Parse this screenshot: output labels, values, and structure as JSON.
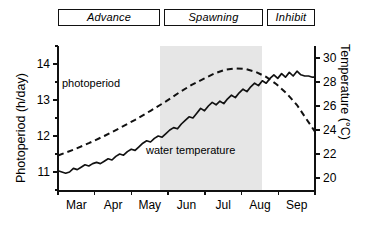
{
  "banner": {
    "phases": [
      {
        "label": "Advance"
      },
      {
        "label": "Spawning"
      },
      {
        "label": "Inhibit"
      }
    ]
  },
  "axes": {
    "left": {
      "title": "Photoperiod (h/day)",
      "ticks": [
        "11",
        "12",
        "13",
        "14"
      ],
      "min": 10.5,
      "max": 14.5
    },
    "right": {
      "title": "Temperature (°C)",
      "ticks": [
        "20",
        "22",
        "24",
        "26",
        "28",
        "30"
      ],
      "min": 19.0,
      "max": 31.0
    },
    "x": {
      "ticks": [
        "Mar",
        "Apr",
        "May",
        "Jun",
        "Jul",
        "Aug",
        "Sep"
      ]
    }
  },
  "series_labels": {
    "photoperiod": "photoperiod",
    "water_temperature": "water temperature"
  },
  "colors": {
    "line": "#111111",
    "shading": "#e6e6e6",
    "background": "#ffffff"
  },
  "chart_data": {
    "type": "line",
    "title": "",
    "xlabel": "",
    "ylabel": "Photoperiod (h/day)",
    "y2label": "Temperature (°C)",
    "ylim": [
      10.5,
      14.5
    ],
    "y2lim": [
      19.0,
      31.0
    ],
    "grid": false,
    "legend": "inline-annotations",
    "x_tick_labels": [
      "Mar",
      "Apr",
      "May",
      "Jun",
      "Jul",
      "Aug",
      "Sep"
    ],
    "shaded_region": {
      "label": "Spawning",
      "x_start": "mid-May",
      "x_end": "mid-Sep"
    },
    "phase_bands": [
      {
        "label": "Advance",
        "x_start": "Feb",
        "x_end": "mid-May"
      },
      {
        "label": "Spawning",
        "x_start": "mid-May",
        "x_end": "mid-Sep"
      },
      {
        "label": "Inhibit",
        "x_start": "mid-Sep",
        "x_end": "Oct"
      }
    ],
    "series": [
      {
        "name": "photoperiod",
        "axis": "left",
        "style": "dashed",
        "units": "h/day",
        "points": [
          {
            "x": 0.0,
            "y": 11.46
          },
          {
            "x": 0.06,
            "y": 11.62
          },
          {
            "x": 0.12,
            "y": 11.8
          },
          {
            "x": 0.18,
            "y": 12.0
          },
          {
            "x": 0.24,
            "y": 12.22
          },
          {
            "x": 0.3,
            "y": 12.45
          },
          {
            "x": 0.36,
            "y": 12.7
          },
          {
            "x": 0.42,
            "y": 12.96
          },
          {
            "x": 0.47,
            "y": 13.2
          },
          {
            "x": 0.52,
            "y": 13.42
          },
          {
            "x": 0.57,
            "y": 13.6
          },
          {
            "x": 0.61,
            "y": 13.74
          },
          {
            "x": 0.65,
            "y": 13.84
          },
          {
            "x": 0.69,
            "y": 13.88
          },
          {
            "x": 0.73,
            "y": 13.86
          },
          {
            "x": 0.77,
            "y": 13.78
          },
          {
            "x": 0.81,
            "y": 13.64
          },
          {
            "x": 0.85,
            "y": 13.44
          },
          {
            "x": 0.89,
            "y": 13.18
          },
          {
            "x": 0.93,
            "y": 12.86
          },
          {
            "x": 0.96,
            "y": 12.54
          },
          {
            "x": 1.0,
            "y": 12.12
          }
        ]
      },
      {
        "name": "water temperature",
        "axis": "right",
        "style": "solid",
        "units": "°C",
        "points": [
          {
            "x": 0.0,
            "y": 20.6
          },
          {
            "x": 0.015,
            "y": 20.5
          },
          {
            "x": 0.03,
            "y": 20.4
          },
          {
            "x": 0.045,
            "y": 20.5
          },
          {
            "x": 0.06,
            "y": 20.8
          },
          {
            "x": 0.075,
            "y": 20.7
          },
          {
            "x": 0.09,
            "y": 20.9
          },
          {
            "x": 0.105,
            "y": 21.1
          },
          {
            "x": 0.12,
            "y": 21.0
          },
          {
            "x": 0.135,
            "y": 21.2
          },
          {
            "x": 0.15,
            "y": 21.3
          },
          {
            "x": 0.165,
            "y": 21.2
          },
          {
            "x": 0.18,
            "y": 21.4
          },
          {
            "x": 0.195,
            "y": 21.6
          },
          {
            "x": 0.21,
            "y": 21.5
          },
          {
            "x": 0.225,
            "y": 21.8
          },
          {
            "x": 0.24,
            "y": 22.0
          },
          {
            "x": 0.255,
            "y": 21.9
          },
          {
            "x": 0.27,
            "y": 22.2
          },
          {
            "x": 0.285,
            "y": 22.4
          },
          {
            "x": 0.3,
            "y": 22.3
          },
          {
            "x": 0.315,
            "y": 22.6
          },
          {
            "x": 0.33,
            "y": 22.9
          },
          {
            "x": 0.345,
            "y": 23.1
          },
          {
            "x": 0.36,
            "y": 23.0
          },
          {
            "x": 0.375,
            "y": 23.3
          },
          {
            "x": 0.39,
            "y": 23.5
          },
          {
            "x": 0.405,
            "y": 23.4
          },
          {
            "x": 0.42,
            "y": 23.7
          },
          {
            "x": 0.435,
            "y": 24.0
          },
          {
            "x": 0.45,
            "y": 24.2
          },
          {
            "x": 0.465,
            "y": 24.1
          },
          {
            "x": 0.48,
            "y": 24.5
          },
          {
            "x": 0.495,
            "y": 24.8
          },
          {
            "x": 0.51,
            "y": 25.1
          },
          {
            "x": 0.525,
            "y": 25.0
          },
          {
            "x": 0.54,
            "y": 25.4
          },
          {
            "x": 0.555,
            "y": 25.8
          },
          {
            "x": 0.57,
            "y": 25.6
          },
          {
            "x": 0.585,
            "y": 26.0
          },
          {
            "x": 0.6,
            "y": 26.3
          },
          {
            "x": 0.615,
            "y": 26.1
          },
          {
            "x": 0.63,
            "y": 26.4
          },
          {
            "x": 0.645,
            "y": 26.2
          },
          {
            "x": 0.66,
            "y": 26.6
          },
          {
            "x": 0.675,
            "y": 26.9
          },
          {
            "x": 0.69,
            "y": 26.7
          },
          {
            "x": 0.705,
            "y": 27.1
          },
          {
            "x": 0.72,
            "y": 27.4
          },
          {
            "x": 0.735,
            "y": 27.2
          },
          {
            "x": 0.75,
            "y": 27.6
          },
          {
            "x": 0.765,
            "y": 27.9
          },
          {
            "x": 0.78,
            "y": 27.7
          },
          {
            "x": 0.795,
            "y": 28.1
          },
          {
            "x": 0.81,
            "y": 27.9
          },
          {
            "x": 0.825,
            "y": 28.3
          },
          {
            "x": 0.84,
            "y": 28.6
          },
          {
            "x": 0.855,
            "y": 28.3
          },
          {
            "x": 0.87,
            "y": 28.7
          },
          {
            "x": 0.885,
            "y": 28.4
          },
          {
            "x": 0.9,
            "y": 28.8
          },
          {
            "x": 0.915,
            "y": 28.5
          },
          {
            "x": 0.93,
            "y": 28.9
          },
          {
            "x": 0.945,
            "y": 28.6
          },
          {
            "x": 0.96,
            "y": 28.5
          },
          {
            "x": 0.975,
            "y": 28.5
          },
          {
            "x": 0.99,
            "y": 28.4
          },
          {
            "x": 1.0,
            "y": 28.4
          }
        ]
      }
    ]
  }
}
